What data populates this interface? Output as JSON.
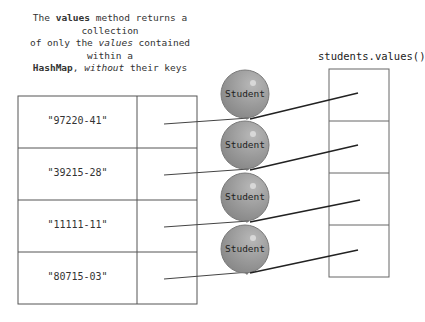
{
  "caption": {
    "line1_pre": "The ",
    "line1_bold": "values",
    "line1_post": " method returns a collection",
    "line2_pre": "of only the ",
    "line2_ital": "values",
    "line2_post": " contained within a",
    "line3_bold": "HashMap",
    "line3_mid": ", ",
    "line3_ital": "without",
    "line3_post": " their keys"
  },
  "collection_label": "students.values()",
  "map": {
    "keys": [
      "\"97220-41\"",
      "\"39215-28\"",
      "\"11111-11\"",
      "\"80715-03\""
    ]
  },
  "balloons": [
    "Student",
    "Student",
    "Student",
    "Student"
  ],
  "colors": {
    "balloon_fill": "#9a9a9a",
    "balloon_stroke": "#7a7a7a",
    "lines": "#333333",
    "border": "#555555"
  }
}
